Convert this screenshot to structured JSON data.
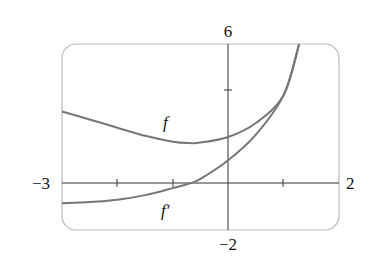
{
  "chart_data": {
    "type": "line",
    "title": "",
    "xlabel": "",
    "ylabel": "",
    "xlim": [
      -3,
      2
    ],
    "ylim": [
      -2,
      6
    ],
    "x_tick_labels": [
      "-3",
      "2"
    ],
    "y_tick_labels": [
      "6",
      "-2"
    ],
    "x_ticks": [
      -2,
      -1,
      1
    ],
    "y_ticks": [
      4
    ],
    "grid": false,
    "legend": "inline curve labels",
    "series": [
      {
        "name": "f",
        "x": [
          -3,
          -2.5,
          -2,
          -1.5,
          -1,
          -0.7,
          -0.5,
          0,
          0.5,
          1,
          1.28
        ],
        "y": [
          3.1,
          2.75,
          2.4,
          2.05,
          1.8,
          1.74,
          1.76,
          2.0,
          2.6,
          3.8,
          6.0
        ]
      },
      {
        "name": "f'",
        "x": [
          -3,
          -2.5,
          -2,
          -1.5,
          -1,
          -0.7,
          -0.5,
          0,
          0.5,
          1,
          1.28
        ],
        "y": [
          -0.85,
          -0.8,
          -0.7,
          -0.5,
          -0.2,
          0.0,
          0.2,
          1.0,
          2.1,
          3.8,
          6.0
        ]
      }
    ],
    "annotations": [
      {
        "text": "f",
        "x": -0.5,
        "y": 2.9
      },
      {
        "text": "f′",
        "x": -0.5,
        "y": -1.1
      }
    ]
  },
  "labels": {
    "xmin": "−3",
    "xmax": "2",
    "ymax": "6",
    "ymin": "−2",
    "f": "f",
    "fprime": "f′"
  }
}
